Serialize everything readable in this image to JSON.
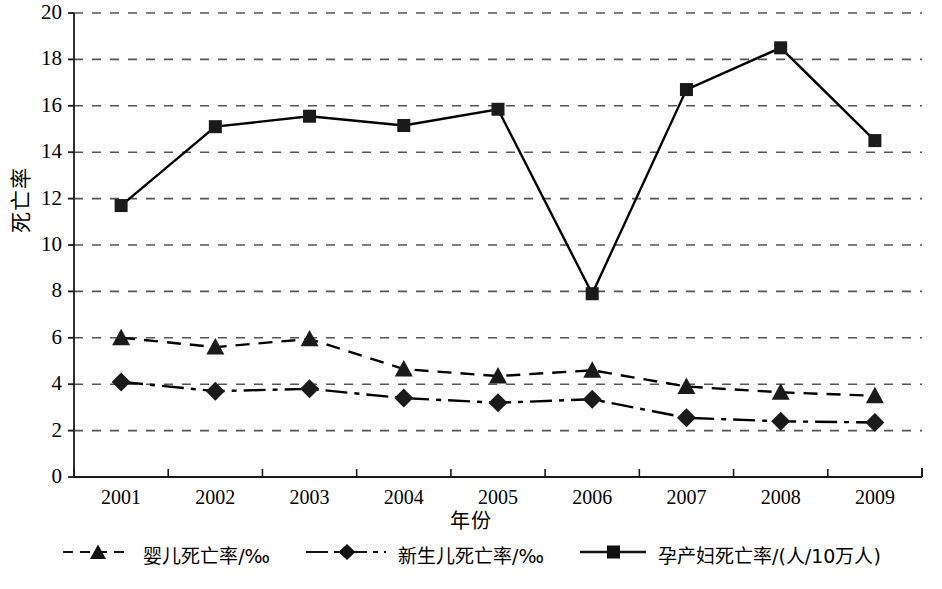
{
  "chart_data": {
    "type": "line",
    "title": "",
    "xlabel": "年份",
    "ylabel": "死亡率",
    "categories": [
      "2001",
      "2002",
      "2003",
      "2004",
      "2005",
      "2006",
      "2007",
      "2008",
      "2009"
    ],
    "x": [
      2001,
      2002,
      2003,
      2004,
      2005,
      2006,
      2007,
      2008,
      2009
    ],
    "ylim": [
      0,
      20
    ],
    "yticks": [
      0,
      2,
      4,
      6,
      8,
      10,
      12,
      14,
      16,
      18,
      20
    ],
    "grid": true,
    "grid_axis": "y",
    "grid_style": "dashed",
    "legend_position": "bottom",
    "series": [
      {
        "name": "婴儿死亡率/‰",
        "marker": "triangle",
        "line_style": "dashed",
        "color": "#000000",
        "values": [
          6.0,
          5.6,
          5.95,
          4.65,
          4.35,
          4.6,
          3.9,
          3.65,
          3.5
        ]
      },
      {
        "name": "新生儿死亡率/‰",
        "marker": "diamond",
        "line_style": "dashdot",
        "color": "#000000",
        "values": [
          4.1,
          3.7,
          3.8,
          3.4,
          3.2,
          3.35,
          2.55,
          2.4,
          2.35
        ]
      },
      {
        "name": "孕产妇死亡率/(人/10万人)",
        "marker": "square",
        "line_style": "solid",
        "color": "#000000",
        "values": [
          11.7,
          15.1,
          15.55,
          15.15,
          15.85,
          7.9,
          16.7,
          18.5,
          14.5
        ]
      }
    ]
  },
  "axes": {
    "y_title": "死亡率",
    "x_title": "年份",
    "y_tick_labels": [
      "0",
      "2",
      "4",
      "6",
      "8",
      "10",
      "12",
      "14",
      "16",
      "18",
      "20"
    ],
    "x_tick_labels": [
      "2001",
      "2002",
      "2003",
      "2004",
      "2005",
      "2006",
      "2007",
      "2008",
      "2009"
    ]
  },
  "legend": {
    "items": [
      {
        "label": "婴儿死亡率/‰",
        "marker": "triangle-marker",
        "line_style": "dashed"
      },
      {
        "label": "新生儿死亡率/‰",
        "marker": "diamond-marker",
        "line_style": "dashdot"
      },
      {
        "label": "孕产妇死亡率/(人/10万人)",
        "marker": "square-marker",
        "line_style": "solid"
      }
    ]
  },
  "style": {
    "ink": "#1a1a1a",
    "grid_color": "#555555",
    "background": "#ffffff"
  }
}
